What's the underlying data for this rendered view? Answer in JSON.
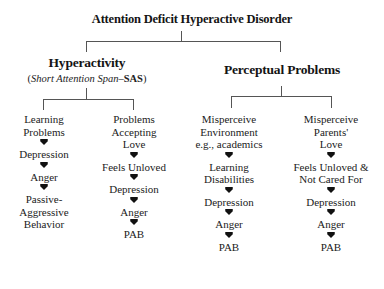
{
  "diagram": {
    "title": "Attention Deficit Hyperactive Disorder",
    "branches": [
      {
        "heading": "Hyperactivity",
        "subtitle_italic": "Short Attention Span",
        "subtitle_dash": "–",
        "subtitle_bold": "SAS",
        "subtitle_open": "(",
        "subtitle_close": ")",
        "columns": [
          {
            "nodes": [
              "Learning\nProblems",
              "Depression",
              "Anger",
              "Passive-\nAggressive\nBehavior"
            ]
          },
          {
            "nodes": [
              "Problems\nAccepting\nLove",
              "Feels Unloved",
              "Depression",
              "Anger",
              "PAB"
            ]
          }
        ]
      },
      {
        "heading": "Perceptual Problems",
        "columns": [
          {
            "nodes": [
              "Misperceive\nEnvironment\ne.g., academics",
              "Learning\nDisabilities",
              "Depression",
              "Anger",
              "PAB"
            ]
          },
          {
            "nodes": [
              "Misperceive\nParents'\nLove",
              "Feels Unloved &\nNot Cared For",
              "Depression",
              "Anger",
              "PAB"
            ]
          }
        ]
      }
    ],
    "arrow_icon": "down-arrow-icon",
    "colors": {
      "text": "#1a1a1a",
      "connector": "#555555",
      "arrow": "#111111",
      "background": "#ffffff"
    }
  }
}
